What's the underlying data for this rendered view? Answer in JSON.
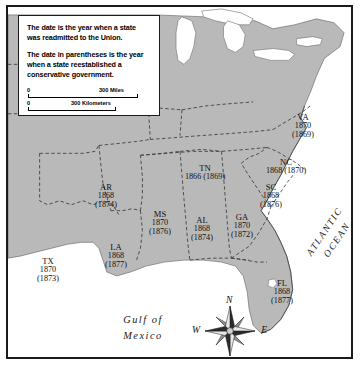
{
  "map": {
    "title": "Reconstruction: Readmission to the Union",
    "land_color": "#b9b9b9",
    "water_color": "#ffffff",
    "border_color": "#1b1b1b"
  },
  "legend": {
    "paragraph_1": "The date is the year when a state was readmitted to the Union.",
    "paragraph_2": "The date in parentheses is the year when a state reestablished a conservative government.",
    "scale": {
      "miles": {
        "zero": "0",
        "label": "300 Miles"
      },
      "kilometers": {
        "zero": "0",
        "label": "300 Kilometers"
      }
    }
  },
  "states": [
    {
      "abbr": "TX",
      "readmitted": "1870",
      "conservative": "(1873)",
      "layout": "stacked",
      "x": 40,
      "y": 250
    },
    {
      "abbr": "AR",
      "readmitted": "1868",
      "conservative": "(1874)",
      "layout": "stacked",
      "x": 98,
      "y": 176
    },
    {
      "abbr": "LA",
      "readmitted": "1868",
      "conservative": "(1877)",
      "layout": "stacked",
      "x": 108,
      "y": 236
    },
    {
      "abbr": "MS",
      "readmitted": "1870",
      "conservative": "(1876)",
      "layout": "stacked",
      "x": 152,
      "y": 203
    },
    {
      "abbr": "AL",
      "readmitted": "1868",
      "conservative": "(1874)",
      "layout": "stacked",
      "x": 194,
      "y": 209
    },
    {
      "abbr": "GA",
      "readmitted": "1870",
      "conservative": "(1872)",
      "layout": "stacked",
      "x": 234,
      "y": 206
    },
    {
      "abbr": "FL",
      "readmitted": "1868",
      "conservative": "(1877)",
      "layout": "stacked",
      "x": 274,
      "y": 272
    },
    {
      "abbr": "SC",
      "readmitted": "1868",
      "conservative": "(1876)",
      "layout": "stacked",
      "x": 263,
      "y": 176
    },
    {
      "abbr": "NC",
      "readmitted": "1868",
      "conservative": "(1870)",
      "layout": "inline",
      "x": 278,
      "y": 151
    },
    {
      "abbr": "VA",
      "readmitted": "1870",
      "conservative": "(1869)",
      "layout": "stacked",
      "x": 295,
      "y": 106
    },
    {
      "abbr": "TN",
      "readmitted": "1866",
      "conservative": "(1869)",
      "layout": "inline",
      "x": 197,
      "y": 157
    }
  ],
  "water_labels": {
    "atlantic_line1": "ATLANTIC",
    "atlantic_line2": "OCEAN",
    "gulf_line1": "Gulf of",
    "gulf_line2": "Mexico"
  },
  "compass": {
    "north": "N",
    "south": "S",
    "east": "E",
    "west": "W"
  }
}
